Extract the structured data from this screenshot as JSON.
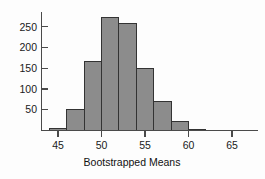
{
  "chart_data": {
    "type": "bar",
    "title": "",
    "subtitle": "",
    "xlabel": "Bootstrapped Means",
    "ylabel": "",
    "grid": false,
    "legend": null,
    "xlim": [
      43,
      66.5
    ],
    "ylim": [
      0,
      285
    ],
    "bin_width": 2,
    "bin_edges": [
      44,
      46,
      48,
      50,
      52,
      54,
      56,
      58,
      60,
      62,
      64,
      66
    ],
    "categories": [
      "44-46",
      "46-48",
      "48-50",
      "50-52",
      "52-54",
      "54-56",
      "56-58",
      "58-60",
      "60-62",
      "62-64",
      "64-66"
    ],
    "bin_centers": [
      45,
      47,
      49,
      51,
      53,
      55,
      57,
      59,
      61,
      63,
      65
    ],
    "values": [
      5,
      51,
      166,
      272,
      258,
      150,
      69,
      22,
      3,
      0,
      0
    ],
    "xticks": [
      45,
      50,
      55,
      60,
      65
    ],
    "xtick_labels": [
      "45",
      "50",
      "55",
      "60",
      "65"
    ],
    "yticks": [
      50,
      100,
      150,
      200,
      250
    ],
    "ytick_labels": [
      "50",
      "100",
      "150",
      "200",
      "250"
    ],
    "bar_fill": "#8c8c8c",
    "bar_stroke": "#333333",
    "axis_color": "#4a4a4a"
  }
}
